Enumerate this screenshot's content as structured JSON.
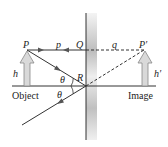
{
  "diagram": {
    "labels": {
      "P": "P",
      "p": "p",
      "Q": "Q",
      "q": "q",
      "P_prime": "P′",
      "h": "h",
      "h_prime": "h′",
      "R": "R",
      "theta_incident": "θ",
      "theta_reflected": "θ",
      "object": "Object",
      "image": "Image"
    },
    "colors": {
      "line": "#333333",
      "arrow_fill": "#d9d9d9",
      "arrow_stroke": "#888888",
      "mirror_light": "#f2f2f2",
      "mirror_dark": "#b8b8b8"
    }
  }
}
